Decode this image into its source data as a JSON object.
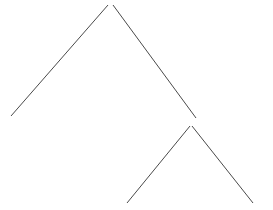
{
  "canvas": {
    "width": 273,
    "height": 210,
    "background_color": "#ffffff"
  },
  "figure": {
    "title": "",
    "stroke_color": "#4a4a4a",
    "stroke_width": 1
  },
  "chart_data": {
    "type": "line",
    "title": "",
    "subtitle": "",
    "xlabel": "",
    "ylabel": "",
    "xlim": [
      0,
      273
    ],
    "ylim": [
      0,
      210
    ],
    "grid": false,
    "legend": null,
    "axes_visible": false,
    "tick_labels_x": [],
    "tick_labels_y": [],
    "annotations": [],
    "series": [
      {
        "name": "large-peak-left-leg",
        "points": [
          {
            "x": 11,
            "y": 116
          },
          {
            "x": 108,
            "y": 5
          }
        ]
      },
      {
        "name": "large-peak-right-leg",
        "points": [
          {
            "x": 113,
            "y": 5
          },
          {
            "x": 196,
            "y": 118
          }
        ]
      },
      {
        "name": "small-peak-left-leg",
        "points": [
          {
            "x": 127,
            "y": 203
          },
          {
            "x": 190,
            "y": 126
          }
        ]
      },
      {
        "name": "small-peak-right-leg",
        "points": [
          {
            "x": 192,
            "y": 126
          },
          {
            "x": 253,
            "y": 203
          }
        ]
      }
    ]
  }
}
